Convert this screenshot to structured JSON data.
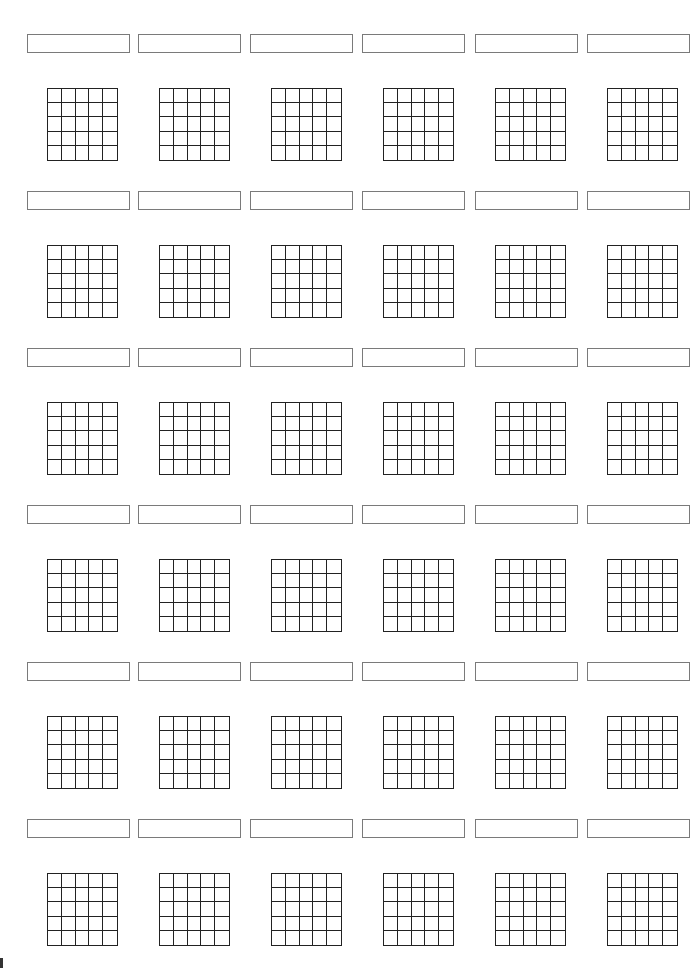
{
  "worksheet": {
    "rows": 6,
    "columns": 6,
    "grid_size": {
      "rows": 5,
      "cols": 5
    },
    "layout": {
      "box_x": [
        27,
        138,
        250,
        362,
        475,
        587
      ],
      "grid_x": [
        47,
        159,
        271,
        383,
        495,
        607
      ],
      "box_y": [
        34,
        191,
        348,
        505,
        662,
        819
      ],
      "grid_y": [
        88,
        245,
        402,
        559,
        716,
        873
      ]
    },
    "colors": {
      "box_border": "#7a7a7a",
      "grid_line": "#222222",
      "background": "#ffffff"
    },
    "labels": [
      [
        "",
        "",
        "",
        "",
        "",
        ""
      ],
      [
        "",
        "",
        "",
        "",
        "",
        ""
      ],
      [
        "",
        "",
        "",
        "",
        "",
        ""
      ],
      [
        "",
        "",
        "",
        "",
        "",
        ""
      ],
      [
        "",
        "",
        "",
        "",
        "",
        ""
      ],
      [
        "",
        "",
        "",
        "",
        "",
        ""
      ]
    ]
  }
}
